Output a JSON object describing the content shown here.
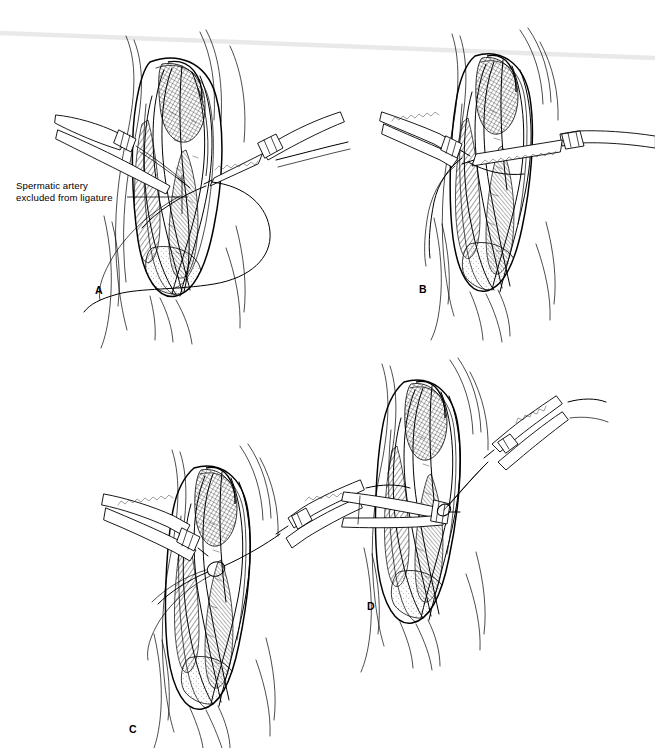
{
  "figure": {
    "background_color": "#ffffff",
    "ink_color": "#000000",
    "width": 655,
    "height": 748,
    "style": "pen-and-ink surgical line drawing, cross-hatched shading"
  },
  "scan_artifact": {
    "name": "horizontal-scan-line",
    "color": "#e9e9e9",
    "from_x": 0,
    "from_y": 33,
    "to_x": 655,
    "to_y": 58
  },
  "annotations": [
    {
      "id": "spermatic-artery",
      "line1": "Spermatic artery",
      "line2": "excluded from ligature",
      "x": 16,
      "y": 180,
      "leader_from_x": 127,
      "leader_from_y": 197,
      "leader_to_x": 188,
      "leader_to_y": 197
    }
  ],
  "panels": [
    {
      "id": "panel-a",
      "letter": "A",
      "label_x": 95,
      "label_y": 284,
      "caption": "Spermatic cord dissected; suture passed around the internal spermatic veins with the spermatic artery excluded from the ligature",
      "instruments": [
        "forceps-left",
        "hemostat-right",
        "suture-loop"
      ]
    },
    {
      "id": "panel-b",
      "letter": "B",
      "label_x": 419,
      "label_y": 283,
      "caption": "Two clamps placed across the cord; suture tails held on either side",
      "instruments": [
        "hemostat-left",
        "hemostat-right",
        "suture-tail"
      ]
    },
    {
      "id": "panel-c",
      "letter": "C",
      "label_x": 129,
      "label_y": 723,
      "caption": "Ligature being tied; clamp holds the proximal cord while the suture is drawn taut to the right",
      "instruments": [
        "clamp-left",
        "needle-holder-right",
        "suture-knot"
      ]
    },
    {
      "id": "panel-d",
      "letter": "D",
      "label_x": 367,
      "label_y": 600,
      "caption": "Completed ligation of the dilated veins; clamp stabilizes the cord as the knot is secured",
      "instruments": [
        "clamp-left",
        "needle-holder-upper-right",
        "tied-suture"
      ]
    }
  ]
}
